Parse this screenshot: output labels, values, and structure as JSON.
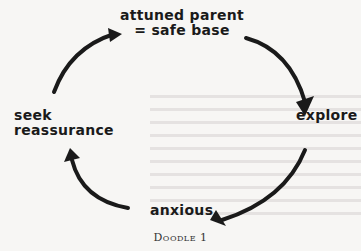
{
  "diagram": {
    "nodes": [
      {
        "id": "top",
        "line1": "attuned parent",
        "line2": "= safe base"
      },
      {
        "id": "right",
        "label": "explore"
      },
      {
        "id": "bottom",
        "label": "anxious"
      },
      {
        "id": "left",
        "line1": "seek",
        "line2": "reassurance"
      }
    ],
    "edges": [
      {
        "from": "top",
        "to": "right"
      },
      {
        "from": "right",
        "to": "bottom"
      },
      {
        "from": "bottom",
        "to": "left"
      },
      {
        "from": "left",
        "to": "top"
      }
    ],
    "caption": "Doodle 1",
    "colors": {
      "ink": "#1a1a1a",
      "paper": "#f7f6f4"
    }
  }
}
